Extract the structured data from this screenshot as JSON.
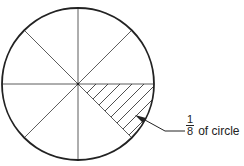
{
  "diagram": {
    "title": "",
    "circle": {
      "cx": 78,
      "cy": 84,
      "r": 76,
      "divisions": 8,
      "shaded_sector_index": 1
    },
    "label": {
      "numerator": "1",
      "denominator": "8",
      "text": "of circle"
    },
    "colors": {
      "stroke": "#222222",
      "background": "#ffffff"
    }
  }
}
